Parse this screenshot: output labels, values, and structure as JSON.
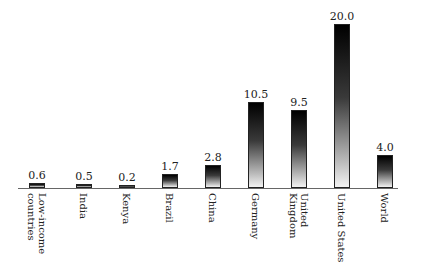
{
  "chart_data": {
    "type": "bar",
    "title": "",
    "xlabel": "",
    "ylabel": "",
    "categories": [
      "Low-income countries",
      "India",
      "Kenya",
      "Brazil",
      "China",
      "Germany",
      "United Kingdom",
      "United States",
      "World"
    ],
    "category_labels_display": [
      "Low-income\ncountries",
      "India",
      "Kenya",
      "Brazil",
      "China",
      "Germany",
      "United\nKingdom",
      "United States",
      "World"
    ],
    "values": [
      0.6,
      0.5,
      0.2,
      1.7,
      2.8,
      10.5,
      9.5,
      20.0,
      4.0
    ],
    "value_labels": [
      "0.6",
      "0.5",
      "0.2",
      "1.7",
      "2.8",
      "10.5",
      "9.5",
      "20.0",
      "4.0"
    ],
    "ylim": [
      0,
      20
    ],
    "grid": false,
    "legend": null,
    "bar_style": "vertical gradient black to white"
  }
}
